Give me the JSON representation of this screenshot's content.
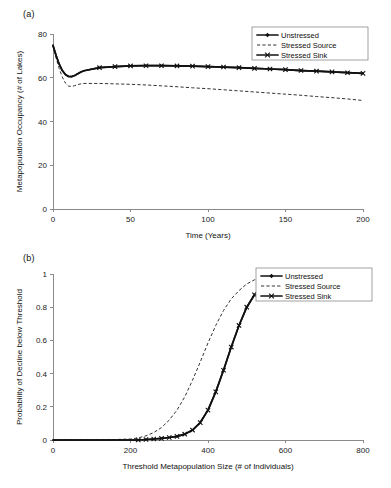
{
  "figure": {
    "panels": [
      {
        "label": "(a)",
        "xlabel": "Time (Years)",
        "ylabel": "Metapopulation Occupancy (# of Lakes)",
        "xticks": [
          "0",
          "50",
          "100",
          "150",
          "200"
        ],
        "yticks": [
          "0",
          "20",
          "40",
          "60",
          "80"
        ],
        "legend": [
          {
            "label": "Unstressed",
            "style": "solid-diamond"
          },
          {
            "label": "Stressed Source",
            "style": "dashed"
          },
          {
            "label": "Stressed Sink",
            "style": "solid-x"
          }
        ]
      },
      {
        "label": "(b)",
        "xlabel": "Threshold Metapopulation Size (# of Individuals)",
        "ylabel": "Probability of Decline below Threshold",
        "xticks": [
          "0",
          "200",
          "400",
          "600",
          "800"
        ],
        "yticks": [
          "0",
          "0.2",
          "0.4",
          "0.6",
          "0.8",
          "1"
        ],
        "legend": [
          {
            "label": "Unstressed",
            "style": "solid-diamond"
          },
          {
            "label": "Stressed Source",
            "style": "dashed"
          },
          {
            "label": "Stressed Sink",
            "style": "solid-x"
          }
        ]
      }
    ]
  },
  "chart_data": [
    {
      "type": "line",
      "title": "(a)",
      "xlabel": "Time (Years)",
      "ylabel": "Metapopulation Occupancy (# of Lakes)",
      "xlim": [
        0,
        200
      ],
      "ylim": [
        0,
        80
      ],
      "xticks": [
        0,
        50,
        100,
        150,
        200
      ],
      "yticks": [
        0,
        20,
        40,
        60,
        80
      ],
      "grid": false,
      "legend_position": "top-right",
      "x": [
        0,
        2,
        4,
        6,
        8,
        10,
        12,
        14,
        16,
        18,
        20,
        30,
        40,
        50,
        60,
        70,
        80,
        90,
        100,
        110,
        120,
        130,
        140,
        150,
        160,
        170,
        180,
        190,
        200
      ],
      "series": [
        {
          "name": "Unstressed",
          "marker": "diamond",
          "linestyle": "solid",
          "values": [
            74.8,
            70.2,
            66.2,
            63.3,
            61.5,
            60.6,
            60.5,
            61.0,
            61.8,
            62.6,
            63.2,
            64.6,
            65.1,
            65.4,
            65.5,
            65.5,
            65.4,
            65.3,
            65.1,
            64.9,
            64.6,
            64.3,
            64.0,
            63.7,
            63.3,
            63.0,
            62.7,
            62.3,
            62.0
          ]
        },
        {
          "name": "Stressed Source",
          "marker": "none",
          "linestyle": "dashed",
          "values": [
            74.8,
            69.0,
            64.2,
            60.3,
            57.6,
            56.2,
            56.0,
            56.4,
            56.9,
            57.2,
            57.4,
            57.4,
            57.2,
            57.0,
            56.7,
            56.3,
            55.9,
            55.4,
            55.0,
            54.5,
            54.0,
            53.5,
            53.0,
            52.5,
            52.0,
            51.4,
            50.9,
            50.3,
            49.6
          ]
        },
        {
          "name": "Stressed Sink",
          "marker": "x",
          "linestyle": "solid",
          "values": [
            74.8,
            70.2,
            66.2,
            63.3,
            61.5,
            60.6,
            60.5,
            61.0,
            61.8,
            62.6,
            63.2,
            64.6,
            65.1,
            65.4,
            65.5,
            65.5,
            65.4,
            65.3,
            65.1,
            64.9,
            64.6,
            64.3,
            64.0,
            63.7,
            63.3,
            63.0,
            62.7,
            62.3,
            62.0
          ]
        }
      ]
    },
    {
      "type": "line",
      "title": "(b)",
      "xlabel": "Threshold Metapopulation Size (# of Individuals)",
      "ylabel": "Probability of Decline below Threshold",
      "xlim": [
        0,
        800
      ],
      "ylim": [
        0,
        1.0
      ],
      "xticks": [
        0,
        200,
        400,
        600,
        800
      ],
      "yticks": [
        0,
        0.2,
        0.4,
        0.6,
        0.8,
        1
      ],
      "grid": false,
      "legend_position": "top-right",
      "x": [
        0,
        50,
        100,
        150,
        200,
        220,
        240,
        260,
        280,
        300,
        320,
        340,
        360,
        380,
        400,
        420,
        440,
        460,
        480,
        500,
        520,
        540,
        560,
        580,
        600,
        620,
        640,
        660,
        680,
        700,
        720,
        740,
        760,
        780,
        800
      ],
      "series": [
        {
          "name": "Unstressed",
          "marker": "diamond",
          "linestyle": "solid",
          "values": [
            0.0,
            0.0,
            0.0,
            0.0,
            0.0,
            0.0,
            0.003,
            0.006,
            0.01,
            0.015,
            0.022,
            0.035,
            0.06,
            0.105,
            0.18,
            0.29,
            0.42,
            0.56,
            0.69,
            0.8,
            0.875,
            0.925,
            0.955,
            0.975,
            0.985,
            0.992,
            0.996,
            0.998,
            0.999,
            1.0,
            1.0,
            1.0,
            1.0,
            1.0,
            1.0
          ]
        },
        {
          "name": "Stressed Source",
          "marker": "none",
          "linestyle": "dashed",
          "values": [
            0.0,
            0.0,
            0.0,
            0.002,
            0.006,
            0.013,
            0.025,
            0.045,
            0.075,
            0.12,
            0.18,
            0.26,
            0.36,
            0.47,
            0.585,
            0.69,
            0.78,
            0.85,
            0.9,
            0.94,
            0.965,
            0.98,
            0.988,
            0.993,
            0.996,
            0.998,
            0.999,
            1.0,
            1.0,
            1.0,
            1.0,
            1.0,
            1.0,
            1.0,
            1.0
          ]
        },
        {
          "name": "Stressed Sink",
          "marker": "x",
          "linestyle": "solid",
          "values": [
            0.0,
            0.0,
            0.0,
            0.0,
            0.0,
            0.0,
            0.003,
            0.006,
            0.01,
            0.015,
            0.022,
            0.035,
            0.06,
            0.105,
            0.18,
            0.29,
            0.42,
            0.56,
            0.69,
            0.8,
            0.875,
            0.925,
            0.955,
            0.975,
            0.985,
            0.992,
            0.996,
            0.998,
            0.999,
            1.0,
            1.0,
            1.0,
            1.0,
            1.0,
            1.0
          ]
        }
      ]
    }
  ]
}
